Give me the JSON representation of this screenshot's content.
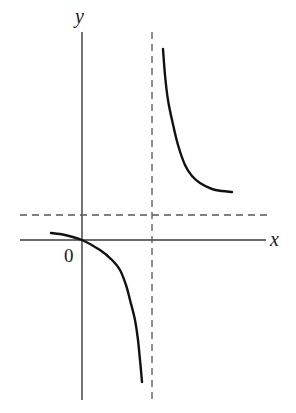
{
  "chart_data": {
    "type": "line",
    "title": "",
    "xlabel": "x",
    "ylabel": "y",
    "origin_label": "0",
    "axes": {
      "x_axis": {
        "from": [
          20,
          240
        ],
        "to": [
          266,
          240
        ]
      },
      "y_axis": {
        "from": [
          82,
          32
        ],
        "to": [
          82,
          400
        ]
      }
    },
    "asymptotes": [
      {
        "type": "vertical",
        "style": "dashed",
        "pixel_x": 152,
        "from_y": 32,
        "to_y": 400
      },
      {
        "type": "horizontal",
        "style": "dashed",
        "pixel_y": 215,
        "from_x": 20,
        "to_x": 267
      }
    ],
    "series": [
      {
        "name": "left-branch",
        "description": "Decreasing branch left of the vertical asymptote, passing through the origin and diving to -infinity as x approaches the asymptote from the left",
        "points": [
          [
            51,
            233
          ],
          [
            65,
            235
          ],
          [
            82,
            240
          ],
          [
            100,
            250
          ],
          [
            112,
            260
          ],
          [
            120,
            270
          ],
          [
            126,
            285
          ],
          [
            130,
            300
          ],
          [
            135,
            320
          ],
          [
            138,
            340
          ],
          [
            140,
            360
          ],
          [
            142,
            382
          ]
        ]
      },
      {
        "name": "right-branch",
        "description": "Decreasing branch right of the vertical asymptote, coming down from +infinity and leveling toward the horizontal asymptote",
        "points": [
          [
            163,
            49
          ],
          [
            165,
            75
          ],
          [
            168,
            100
          ],
          [
            172,
            120
          ],
          [
            178,
            145
          ],
          [
            185,
            165
          ],
          [
            192,
            176
          ],
          [
            200,
            183
          ],
          [
            212,
            189
          ],
          [
            222,
            191
          ],
          [
            232,
            192
          ]
        ]
      }
    ],
    "grid": false,
    "legend": null
  },
  "labels": {
    "x": "x",
    "y": "y",
    "origin": "0"
  },
  "colors": {
    "axis": "#3a3a3a",
    "curve": "#111111",
    "asymptote": "#555555",
    "background": "#ffffff"
  }
}
